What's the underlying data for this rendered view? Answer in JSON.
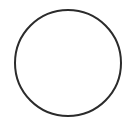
{
  "shape": {
    "type": "circle",
    "cx": 68,
    "cy": 63,
    "r": 53,
    "stroke": "#2b2b2b",
    "stroke_width": 2,
    "fill": "#ffffff"
  }
}
